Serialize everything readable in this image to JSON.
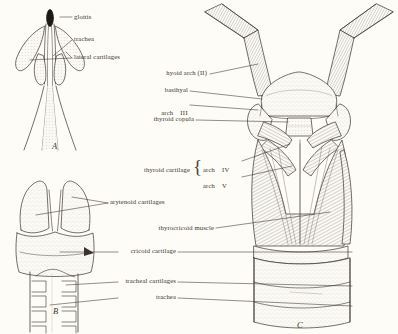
{
  "plate": {
    "title": "Comparative anatomy of the amphibian larynx and trachea",
    "background_color": "#fdfcf7",
    "ink_color": "#3a332b",
    "stipple_color": "#8d857a"
  },
  "panels": [
    {
      "id": "A",
      "letter": "A",
      "caption": "dorsal view of laryngeal skeleton"
    },
    {
      "id": "B",
      "letter": "B",
      "caption": "ventral view of cricoid and trachea"
    },
    {
      "id": "C",
      "letter": "C",
      "caption": "ventral view of hyoid and laryngeal apparatus"
    }
  ],
  "labels_a": [
    {
      "name": "glottis",
      "text": "glottis"
    },
    {
      "name": "trachea",
      "text": "trachea"
    },
    {
      "name": "lateral-cartilages",
      "text": "lateral cartilages"
    }
  ],
  "labels_b": [
    {
      "name": "arytenoid-cartilages",
      "text": "arytenoid cartilages"
    },
    {
      "name": "cricoid-cartilage",
      "text": "cricoid cartilage"
    },
    {
      "name": "tracheal-cartilages",
      "text": "tracheal cartilages"
    },
    {
      "name": "trachea",
      "text": "trachea"
    }
  ],
  "labels_c": [
    {
      "name": "hyoid-arch",
      "text": "hyoid arch (II)"
    },
    {
      "name": "basihyal",
      "text": "basihyal"
    },
    {
      "name": "arch-iii",
      "text": "arch",
      "roman": "III"
    },
    {
      "name": "thyroid-copula",
      "text": "thyroid copula"
    },
    {
      "name": "thyroid-cartilage",
      "text": "thyroid cartilage"
    },
    {
      "name": "arch-iv",
      "text": "arch",
      "roman": "IV"
    },
    {
      "name": "arch-v",
      "text": "arch",
      "roman": "V"
    },
    {
      "name": "thyrocricoid-muscle",
      "text": "thyrocricoid muscle"
    }
  ],
  "brace": {
    "glyph": "{"
  }
}
